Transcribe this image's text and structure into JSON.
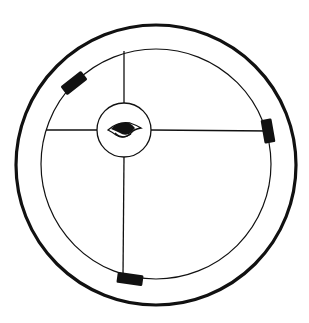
{
  "diagram": {
    "title": "",
    "colors": {
      "stroke": "#111111",
      "fill_block": "#111111",
      "background": "#ffffff"
    },
    "outer_ring": {
      "cx": 156,
      "cy": 165,
      "r": 140,
      "stroke_width": 3.2
    },
    "inner_ring": {
      "cx": 156,
      "cy": 164,
      "r": 115,
      "stroke_width": 1.2
    },
    "hub": {
      "cx": 124,
      "cy": 130,
      "r": 27,
      "icon": "eye-icon"
    },
    "spokes": [
      {
        "name": "spoke-top",
        "x1": 124,
        "y1": 103,
        "x2": 124,
        "y2": 51
      },
      {
        "name": "spoke-left",
        "x1": 97,
        "y1": 130,
        "x2": 46,
        "y2": 130
      },
      {
        "name": "spoke-right",
        "x1": 151,
        "y1": 130,
        "x2": 270,
        "y2": 131
      },
      {
        "name": "spoke-bottom",
        "x1": 124,
        "y1": 157,
        "x2": 123,
        "y2": 276
      }
    ],
    "blocks": [
      {
        "name": "block-upper-left",
        "cx": 74,
        "cy": 83,
        "w": 26,
        "h": 11,
        "rotate": -38
      },
      {
        "name": "block-right",
        "cx": 268,
        "cy": 131,
        "w": 24,
        "h": 11,
        "rotate": 80
      },
      {
        "name": "block-bottom",
        "cx": 130,
        "cy": 279,
        "w": 26,
        "h": 11,
        "rotate": 8
      }
    ]
  }
}
